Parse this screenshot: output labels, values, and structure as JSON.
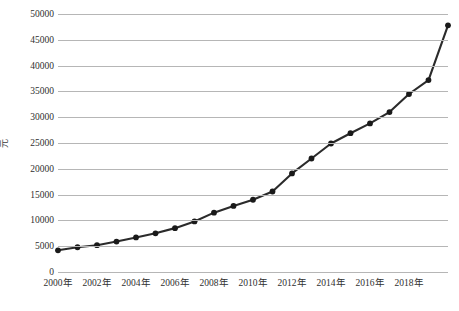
{
  "chart_data": {
    "type": "line",
    "title": "",
    "xlabel": "",
    "ylabel": "元",
    "ylim": [
      0,
      50000
    ],
    "xlim": [
      2000,
      2019
    ],
    "grid": true,
    "legend": false,
    "y_ticks": [
      50000,
      45000,
      40000,
      35000,
      30000,
      25000,
      20000,
      15000,
      10000,
      5000,
      0
    ],
    "y_tick_labels": [
      "50000",
      "45000",
      "40000",
      "35000",
      "30000",
      "25000",
      "20000",
      "15000",
      "10000",
      "5000",
      "0"
    ],
    "x_ticks": [
      2000,
      2002,
      2004,
      2006,
      2008,
      2010,
      2012,
      2014,
      2016,
      2018
    ],
    "x_tick_labels": [
      "2000年",
      "2002年",
      "2004年",
      "2006年",
      "2008年",
      "2010年",
      "2012年",
      "2014年",
      "2016年",
      "2018年"
    ],
    "marker": "circle",
    "line_color": "#2b2b2b",
    "marker_color": "#1a1a1a",
    "grid_color": "#b6b6b6",
    "x": [
      2000,
      2001,
      2002,
      2003,
      2004,
      2005,
      2006,
      2007,
      2008,
      2009,
      2010,
      2011,
      2012,
      2013,
      2014,
      2015,
      2016,
      2017,
      2018,
      2019
    ],
    "values": [
      4200,
      4800,
      5200,
      5900,
      6700,
      7500,
      8500,
      9800,
      11500,
      12800,
      14000,
      15600,
      19100,
      22000,
      24900,
      26900,
      28800,
      31000,
      34500,
      37200
    ],
    "series": [
      {
        "name": "",
        "values": [
          4200,
          4800,
          5200,
          5900,
          6700,
          7500,
          8500,
          9800,
          11500,
          12800,
          14000,
          15600,
          19100,
          22000,
          24900,
          26900,
          28800,
          31000,
          34500,
          37200
        ]
      }
    ],
    "last_point": {
      "x": 2020,
      "value": 47800
    }
  }
}
